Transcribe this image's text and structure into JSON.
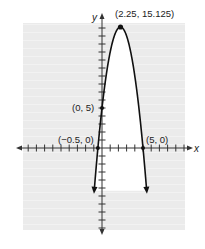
{
  "chart_data": {
    "type": "line",
    "title": "",
    "function": "y = -2x^2 + 9x + 5",
    "xlabel": "x",
    "ylabel": "y",
    "xlim": [
      -10,
      10
    ],
    "ylim": [
      -10,
      16
    ],
    "grid": true,
    "tick_step": 1,
    "series": [
      {
        "name": "parabola",
        "x": [
          -0.9,
          -0.5,
          0,
          1,
          2,
          2.25,
          3,
          4,
          5,
          5.4
        ],
        "y": [
          -3.7,
          0,
          5,
          12,
          15,
          15.125,
          14,
          9,
          0,
          -4.7
        ]
      }
    ],
    "annotations": [
      {
        "label": "(2.25, 15.125)",
        "x": 2.25,
        "y": 15.125,
        "kind": "vertex"
      },
      {
        "label": "(0, 5)",
        "x": 0,
        "y": 5,
        "kind": "y-intercept"
      },
      {
        "label": "(−0.5, 0)",
        "x": -0.5,
        "y": 0,
        "kind": "x-intercept"
      },
      {
        "label": "(5, 0)",
        "x": 5,
        "y": 0,
        "kind": "x-intercept"
      }
    ]
  },
  "labels": {
    "x_axis": "x",
    "y_axis": "y",
    "vertex": "(2.25, 15.125)",
    "y_intercept": "(0, 5)",
    "x_intercept_left": "(−0.5, 0)",
    "x_intercept_right": "(5, 0)"
  },
  "colors": {
    "grid_bg": "#ececec",
    "grid_line": "#f6f6f6",
    "curve": "#111111",
    "axis": "#333333"
  }
}
